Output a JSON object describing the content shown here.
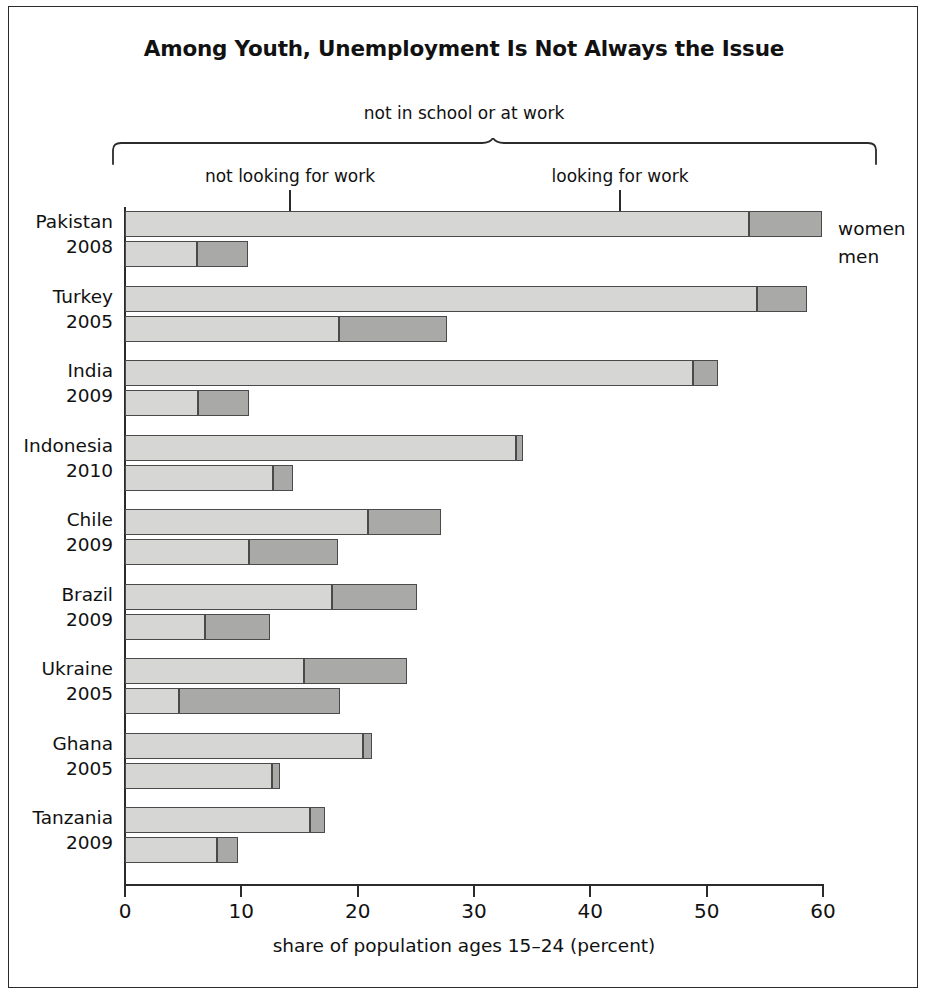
{
  "chart_data": {
    "type": "bar",
    "orientation": "horizontal",
    "stacked": true,
    "title": "Among Youth, Unemployment Is Not Always the Issue",
    "bracket_caption": "not in school or at work",
    "segment_labels": [
      "not looking for work",
      "looking for work"
    ],
    "series_labels": [
      "women",
      "men"
    ],
    "xlabel": "share of population ages 15–24 (percent)",
    "ylabel": "",
    "xlim": [
      0,
      60
    ],
    "xticks": [
      0,
      10,
      20,
      30,
      40,
      50,
      60
    ],
    "xticklabels": [
      "0",
      "10",
      "20",
      "30",
      "40",
      "50",
      "60"
    ],
    "grid": false,
    "legend_position": "right",
    "colors": {
      "not_looking_for_work": "#d6d6d4",
      "looking_for_work": "#a9a9a7",
      "outline": "#4a4a4a",
      "axis": "#2b2b2b",
      "text": "#111111"
    },
    "categories": [
      {
        "country": "Pakistan",
        "year": "2008"
      },
      {
        "country": "Turkey",
        "year": "2005"
      },
      {
        "country": "India",
        "year": "2009"
      },
      {
        "country": "Indonesia",
        "year": "2010"
      },
      {
        "country": "Chile",
        "year": "2009"
      },
      {
        "country": "Brazil",
        "year": "2009"
      },
      {
        "country": "Ukraine",
        "year": "2005"
      },
      {
        "country": "Ghana",
        "year": "2005"
      },
      {
        "country": "Tanzania",
        "year": "2009"
      }
    ],
    "rows": [
      {
        "country": "Pakistan",
        "year": "2008",
        "women": {
          "not_looking_for_work": 53.6,
          "looking_for_work": 6.3,
          "total": 59.9
        },
        "men": {
          "not_looking_for_work": 6.2,
          "looking_for_work": 4.4,
          "total": 10.6
        }
      },
      {
        "country": "Turkey",
        "year": "2005",
        "women": {
          "not_looking_for_work": 54.3,
          "looking_for_work": 4.3,
          "total": 58.6
        },
        "men": {
          "not_looking_for_work": 18.4,
          "looking_for_work": 9.3,
          "total": 27.7
        }
      },
      {
        "country": "India",
        "year": "2009",
        "women": {
          "not_looking_for_work": 48.8,
          "looking_for_work": 2.2,
          "total": 51.0
        },
        "men": {
          "not_looking_for_work": 6.3,
          "looking_for_work": 4.4,
          "total": 10.7
        }
      },
      {
        "country": "Indonesia",
        "year": "2010",
        "women": {
          "not_looking_for_work": 33.6,
          "looking_for_work": 0.6,
          "total": 34.2
        },
        "men": {
          "not_looking_for_work": 12.7,
          "looking_for_work": 1.7,
          "total": 14.4
        }
      },
      {
        "country": "Chile",
        "year": "2009",
        "women": {
          "not_looking_for_work": 20.9,
          "looking_for_work": 6.3,
          "total": 27.2
        },
        "men": {
          "not_looking_for_work": 10.7,
          "looking_for_work": 7.6,
          "total": 18.3
        }
      },
      {
        "country": "Brazil",
        "year": "2009",
        "women": {
          "not_looking_for_work": 17.8,
          "looking_for_work": 7.3,
          "total": 25.1
        },
        "men": {
          "not_looking_for_work": 6.9,
          "looking_for_work": 5.6,
          "total": 12.5
        }
      },
      {
        "country": "Ukraine",
        "year": "2005",
        "women": {
          "not_looking_for_work": 15.4,
          "looking_for_work": 8.8,
          "total": 24.2
        },
        "men": {
          "not_looking_for_work": 4.6,
          "looking_for_work": 13.9,
          "total": 18.5
        }
      },
      {
        "country": "Ghana",
        "year": "2005",
        "women": {
          "not_looking_for_work": 20.5,
          "looking_for_work": 0.7,
          "total": 21.2
        },
        "men": {
          "not_looking_for_work": 12.6,
          "looking_for_work": 0.7,
          "total": 13.3
        }
      },
      {
        "country": "Tanzania",
        "year": "2009",
        "women": {
          "not_looking_for_work": 15.9,
          "looking_for_work": 1.3,
          "total": 17.2
        },
        "men": {
          "not_looking_for_work": 7.9,
          "looking_for_work": 1.8,
          "total": 9.7
        }
      }
    ]
  }
}
